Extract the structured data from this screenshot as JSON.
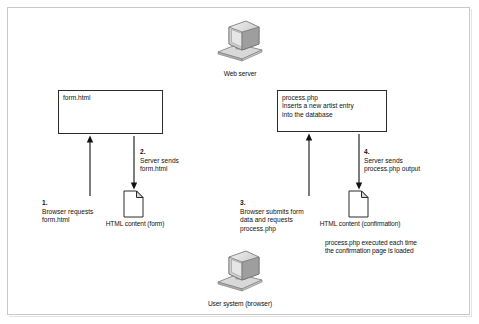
{
  "figure": {
    "background": "#ffffff",
    "frame_color": "#c9c9c9",
    "line_color": "#2b2b2b",
    "box_shadow_color": "#a9a9a9"
  },
  "nodes": {
    "web_server": {
      "label": "Web server",
      "icon": "computer-icon"
    },
    "user_system": {
      "label": "User system (browser)",
      "icon": "computer-icon"
    },
    "form_box": {
      "text": "form.html"
    },
    "process_box": {
      "text": "process.php\nInserts a new artist entry\ninto the database"
    },
    "form_output_doc": {
      "label": "HTML content (form)",
      "icon": "document-icon"
    },
    "confirmation_doc": {
      "label": "HTML content (confirmation)",
      "icon": "document-icon"
    }
  },
  "steps": [
    {
      "number": "1.",
      "text": "Browser requests\nform.html"
    },
    {
      "number": "2.",
      "text": "Server sends\nform.html"
    },
    {
      "number": "3.",
      "text": "Browser submits form\ndata and requests\nprocess.php"
    },
    {
      "number": "4.",
      "text": "Server sends\nprocess.php output"
    }
  ],
  "notes": {
    "process_note": "process.php executed each time\nthe confirmation page is loaded"
  }
}
